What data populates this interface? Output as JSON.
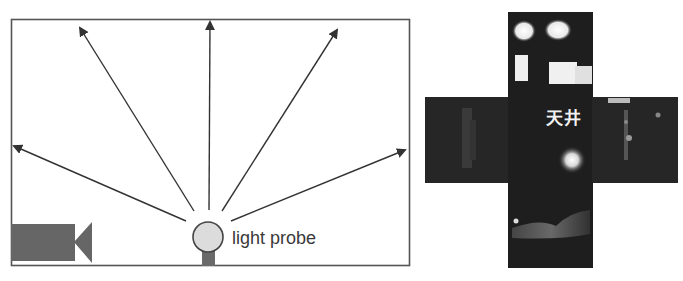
{
  "diagram": {
    "left": {
      "title": "Light probe capture setup",
      "probe_label": "light probe",
      "elements": [
        "room-frame",
        "camera",
        "light-probe-sphere",
        "ray-arrows"
      ],
      "arrow_count": 6,
      "colors": {
        "frame": "#555555",
        "arrow": "#333333",
        "camera": "#666666",
        "probe_fill": "#dcdcdc",
        "probe_stroke": "#444444",
        "stem": "#6a6a6a"
      }
    },
    "right": {
      "title": "Cube map (unfolded cross)",
      "ceiling_label": "天井",
      "faces": [
        "top",
        "left",
        "center",
        "right",
        "bottom"
      ],
      "colors": {
        "face_bg": "#1e1e1e",
        "window_light": "#f4f4f4",
        "label": "#f2f2f2"
      }
    }
  }
}
